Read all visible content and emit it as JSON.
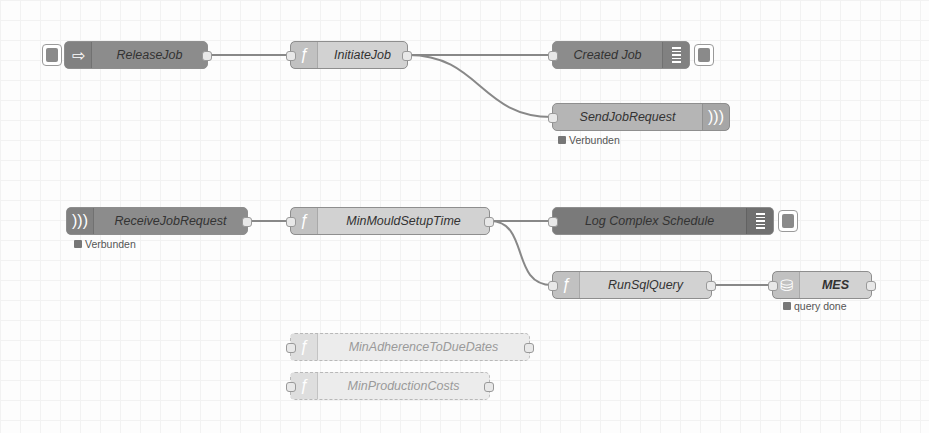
{
  "nodes": {
    "release_job": {
      "label": "ReleaseJob",
      "icon": "inject-arrow-icon"
    },
    "initiate_job": {
      "label": "InitiateJob",
      "icon": "function-icon"
    },
    "created_job": {
      "label": "Created Job",
      "icon": "debug-icon"
    },
    "send_job_request": {
      "label": "SendJobRequest",
      "icon": "websocket-out-icon",
      "status": "Verbunden"
    },
    "receive_job_request": {
      "label": "ReceiveJobRequest",
      "icon": "websocket-in-icon",
      "status": "Verbunden"
    },
    "min_mould_setup_time": {
      "label": "MinMouldSetupTime",
      "icon": "function-icon"
    },
    "log_complex_schedule": {
      "label": "Log Complex Schedule",
      "icon": "debug-icon"
    },
    "run_sql_query": {
      "label": "RunSqlQuery",
      "icon": "function-icon"
    },
    "mes": {
      "label": "MES",
      "icon": "database-icon",
      "status": "query done"
    },
    "min_adherence": {
      "label": "MinAdherenceToDueDates",
      "icon": "function-icon",
      "disabled": true
    },
    "min_production_costs": {
      "label": "MinProductionCosts",
      "icon": "function-icon",
      "disabled": true
    }
  },
  "colors": {
    "wire": "#888888",
    "dark_node": "#8c8c8c",
    "mid_node": "#b5b5b5",
    "light_node": "#d2d2d2"
  }
}
